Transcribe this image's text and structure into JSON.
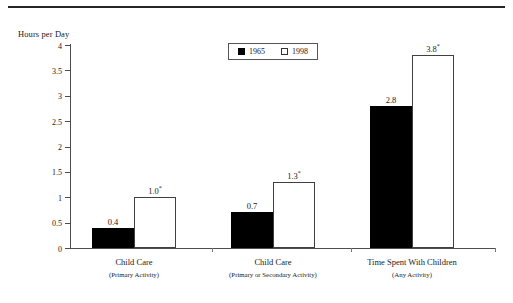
{
  "chart_data": {
    "type": "bar",
    "title": "",
    "xlabel": "",
    "ylabel": "Hours per Day",
    "ylim": [
      0,
      4
    ],
    "ytick_labels": [
      "0",
      "0.5",
      "1",
      "1.5",
      "2",
      "2.5",
      "3",
      "3.5",
      "4"
    ],
    "ytick_values": [
      0,
      0.5,
      1,
      1.5,
      2,
      2.5,
      3,
      3.5,
      4
    ],
    "grid": false,
    "legend_position": "top-center",
    "categories": [
      "Child Care",
      "Child Care",
      "Time Spent With Children"
    ],
    "category_sublabels": [
      "(Primary Activity)",
      "(Primary or Secondary Activity)",
      "(Any Activity)"
    ],
    "series": [
      {
        "name": "1965",
        "color": "#000000",
        "values": [
          0.4,
          0.7,
          2.8
        ],
        "point_labels": [
          "0.4",
          "0.7",
          "2.8"
        ],
        "point_label_marks": [
          "",
          "",
          ""
        ]
      },
      {
        "name": "1998",
        "color": "#ffffff",
        "values": [
          1.0,
          1.3,
          3.8
        ],
        "point_labels": [
          "1.0",
          "1.3",
          "3.8"
        ],
        "point_label_marks": [
          "*",
          "*",
          "*"
        ]
      }
    ]
  },
  "legend": {
    "entries": [
      {
        "label": "1965",
        "swatch": "filled-square"
      },
      {
        "label": "1998",
        "swatch": "hollow-square"
      }
    ]
  },
  "axis": {
    "y_title": "Hours per Day",
    "ticks": [
      {
        "label": "4"
      },
      {
        "label": "3.5"
      },
      {
        "label": "3"
      },
      {
        "label": "2.5"
      },
      {
        "label": "2"
      },
      {
        "label": "1.5"
      },
      {
        "label": "1"
      },
      {
        "label": "0.5"
      },
      {
        "label": "0"
      }
    ]
  },
  "groups": [
    {
      "label": "Child Care",
      "sublabel": "(Primary Activity)",
      "bars": [
        {
          "series": "1965",
          "value": 0.4,
          "label": "0.4",
          "mark": ""
        },
        {
          "series": "1998",
          "value": 1.0,
          "label": "1.0",
          "mark": "*"
        }
      ]
    },
    {
      "label": "Child Care",
      "sublabel": "(Primary or Secondary Activity)",
      "bars": [
        {
          "series": "1965",
          "value": 0.7,
          "label": "0.7",
          "mark": ""
        },
        {
          "series": "1998",
          "value": 1.3,
          "label": "1.3",
          "mark": "*"
        }
      ]
    },
    {
      "label": "Time Spent With Children",
      "sublabel": "(Any Activity)",
      "bars": [
        {
          "series": "1965",
          "value": 2.8,
          "label": "2.8",
          "mark": ""
        },
        {
          "series": "1998",
          "value": 3.8,
          "label": "3.8",
          "mark": "*"
        }
      ]
    }
  ]
}
